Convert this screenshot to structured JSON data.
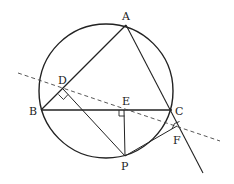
{
  "diagram": {
    "type": "geometry",
    "stroke_color": "#222222",
    "points": {
      "A": {
        "label": "A",
        "x": 126,
        "y": 25
      },
      "B": {
        "label": "B",
        "x": 41,
        "y": 110
      },
      "C": {
        "label": "C",
        "x": 172,
        "y": 110
      },
      "D": {
        "label": "D",
        "x": 63,
        "y": 90
      },
      "E": {
        "label": "E",
        "x": 124,
        "y": 110
      },
      "F": {
        "label": "F",
        "x": 177,
        "y": 127
      },
      "P": {
        "label": "P",
        "x": 125,
        "y": 156
      }
    },
    "circle": {
      "cx": 106,
      "cy": 91,
      "r": 67
    },
    "segments": [
      "AB",
      "AC (extended beyond C)",
      "BC",
      "PD",
      "PE",
      "PF",
      "PC"
    ],
    "dashed_line": "Simson line through D, E, F",
    "right_angles": [
      "D",
      "E",
      "F"
    ]
  }
}
